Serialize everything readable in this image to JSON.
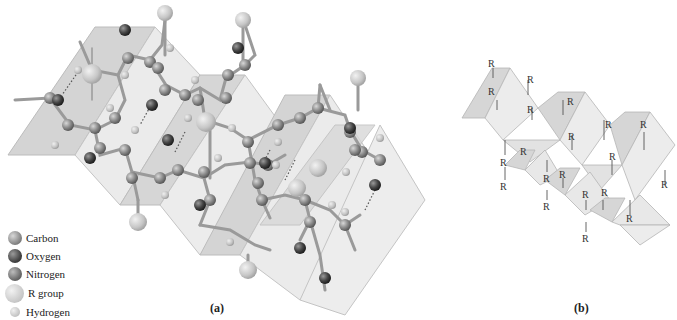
{
  "figure": {
    "panel_a": {
      "label": "(a)",
      "description": "Ball-and-stick model of a beta-pleated sheet on pleated planes"
    },
    "panel_b": {
      "label": "(b)",
      "description": "Schematic pleated sheet with R groups above and below the planes",
      "r_group_label": "R"
    },
    "legend": {
      "items": [
        {
          "label": "Carbon",
          "color": "#8a8a8a",
          "size": 14
        },
        {
          "label": "Oxygen",
          "color": "#4a4a4a",
          "size": 14
        },
        {
          "label": "Nitrogen",
          "color": "#6e6e6e",
          "size": 14
        },
        {
          "label": "R group",
          "color": "#c4c4c4",
          "size": 20
        },
        {
          "label": "Hydrogen",
          "color": "#bdbdbd",
          "size": 11
        }
      ]
    },
    "colors": {
      "plane_light": "#ececec",
      "plane_dark": "#d2d2d2",
      "plane_edge": "#b8b8b8",
      "bond": "#9a9a9a",
      "carbon": "#8a8a8a",
      "oxygen": "#4a4a4a",
      "nitrogen": "#6e6e6e",
      "r_group": "#c8c8c8",
      "hydrogen": "#c0c0c0"
    }
  }
}
